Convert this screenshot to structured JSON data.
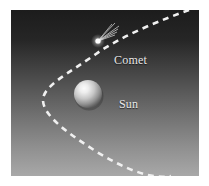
{
  "figure": {
    "width": 209,
    "height": 186,
    "background_color": "#ffffff",
    "panel": {
      "x": 11,
      "y": 10,
      "width": 188,
      "height": 166,
      "gradient_top_color": "#1f1f1f",
      "gradient_bottom_color": "#a6a6a6"
    }
  },
  "labels": {
    "comet": "Comet",
    "sun": "Sun",
    "text_color": "#e8e8e8"
  },
  "objects": {
    "sun": {
      "name": "sun-sphere",
      "cx": 77,
      "cy": 84,
      "r": 14,
      "highlight_color": "#f2f2f2",
      "body_color": "#9a9a9a",
      "shadow_color": "#4a4a4a"
    },
    "comet": {
      "name": "comet-nucleus",
      "cx": 87,
      "cy": 31,
      "r": 2.6,
      "color": "#ffffff",
      "tail_direction": "up-right",
      "tail_ray_count": 6
    },
    "orbit": {
      "name": "orbit-path",
      "type": "parabola",
      "color": "#f0f0f0",
      "dash_pattern": "6 5",
      "stroke_width": 2.6,
      "path": "M 178 0 C 150 10, 110 26, 85 44 C 58 63, 32 76, 32 90 C 32 106, 58 124, 86 142 C 112 158, 140 170, 160 166"
    }
  },
  "chart_data": {
    "type": "scatter",
    "xlabel": "",
    "ylabel": "",
    "annotations": [
      "Comet",
      "Sun"
    ],
    "series": [
      {
        "name": "Sun",
        "x": [
          77
        ],
        "y": [
          84
        ]
      },
      {
        "name": "Comet",
        "x": [
          87
        ],
        "y": [
          31
        ]
      }
    ],
    "curves": [
      {
        "name": "Orbit (parabolic trajectory)",
        "style": "dashed",
        "color": "#f0f0f0",
        "x": [
          178,
          150,
          110,
          85,
          58,
          32,
          32,
          58,
          86,
          112,
          140,
          160
        ],
        "y": [
          0,
          10,
          26,
          44,
          63,
          76,
          90,
          124,
          142,
          158,
          170,
          166
        ]
      }
    ],
    "grid": false,
    "legend": "none"
  }
}
